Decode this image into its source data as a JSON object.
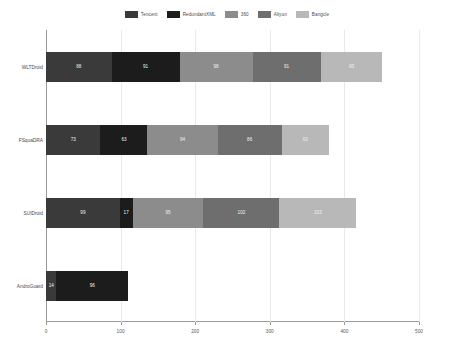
{
  "chart_data": {
    "type": "bar",
    "orientation": "horizontal",
    "stacked": true,
    "title": "",
    "xlabel": "",
    "ylabel": "",
    "xlim": [
      0,
      500
    ],
    "xticks": [
      0,
      100,
      200,
      300,
      400,
      500
    ],
    "xtick_labels": [
      "0",
      "100",
      "200",
      "300",
      "400",
      "500"
    ],
    "grid": true,
    "legend_position": "top-center",
    "categories": [
      "WLTDroid",
      "FSquaDRA",
      "SUIDroid",
      "AndroGuard"
    ],
    "series": [
      {
        "name": "Tencent",
        "color": "#3a3a3a",
        "values": [
          88,
          73,
          99,
          14
        ]
      },
      {
        "name": "RedundantXML",
        "color": "#1c1c1c",
        "values": [
          91,
          63,
          17,
          96
        ]
      },
      {
        "name": "360",
        "color": "#8c8c8c",
        "values": [
          98,
          94,
          95,
          0
        ]
      },
      {
        "name": "Aliyun",
        "color": "#6e6e6e",
        "values": [
          91,
          86,
          102,
          0
        ]
      },
      {
        "name": "Bangcle",
        "color": "#b8b8b8",
        "values": [
          83,
          63,
          103,
          0
        ]
      }
    ],
    "totals": [
      451,
      379,
      416,
      110
    ]
  },
  "legend": {
    "items": [
      {
        "label": "Tencent",
        "color": "#3a3a3a"
      },
      {
        "label": "RedundantXML",
        "color": "#1c1c1c"
      },
      {
        "label": "360",
        "color": "#8c8c8c"
      },
      {
        "label": "Aliyun",
        "color": "#6e6e6e"
      },
      {
        "label": "Bangcle",
        "color": "#b8b8b8"
      }
    ]
  }
}
